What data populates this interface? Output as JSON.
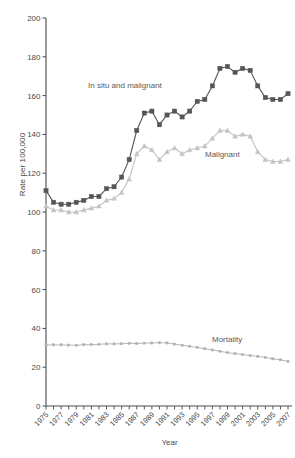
{
  "chart_data": {
    "type": "line",
    "title": "",
    "xlabel": "Year",
    "ylabel": "Rate per 100,000",
    "xlim": [
      1975,
      2007
    ],
    "ylim": [
      0,
      200
    ],
    "yticks": [
      0,
      20,
      40,
      60,
      80,
      100,
      120,
      140,
      160,
      180,
      200
    ],
    "ytick_labels": [
      "0",
      "20",
      "40",
      "60",
      "80",
      "100",
      "120",
      "140",
      "160",
      "180",
      "200"
    ],
    "xticks": [
      1975,
      1976,
      1977,
      1978,
      1979,
      1980,
      1981,
      1982,
      1983,
      1984,
      1985,
      1986,
      1987,
      1988,
      1989,
      1990,
      1991,
      1992,
      1993,
      1994,
      1995,
      1996,
      1997,
      1998,
      1999,
      2000,
      2001,
      2002,
      2003,
      2004,
      2005,
      2006,
      2007
    ],
    "xtick_labels": [
      "1975",
      "",
      "1977",
      "",
      "1979",
      "",
      "1981",
      "",
      "1983",
      "",
      "1985",
      "",
      "1987",
      "",
      "1989",
      "",
      "1991",
      "",
      "1993",
      "",
      "1995",
      "",
      "1997",
      "",
      "1999",
      "",
      "2001",
      "",
      "2003",
      "",
      "2005",
      "",
      "2007"
    ],
    "grid": false,
    "legend_position": "inline-annotations",
    "x": [
      1975,
      1976,
      1977,
      1978,
      1979,
      1980,
      1981,
      1982,
      1983,
      1984,
      1985,
      1986,
      1987,
      1988,
      1989,
      1990,
      1991,
      1992,
      1993,
      1994,
      1995,
      1996,
      1997,
      1998,
      1999,
      2000,
      2001,
      2002,
      2003,
      2004,
      2005,
      2006,
      2007
    ],
    "series": [
      {
        "name": "In situ and malignant",
        "label": "In situ and malignant",
        "color": "#555555",
        "marker": "square",
        "values": [
          111,
          105,
          104,
          104,
          105,
          106,
          108,
          108,
          112,
          113,
          118,
          127,
          142,
          151,
          152,
          145,
          150,
          152,
          149,
          152,
          157,
          158,
          165,
          174,
          175,
          172,
          174,
          173,
          165,
          159,
          158,
          158,
          161
        ]
      },
      {
        "name": "Malignant",
        "label": "Malignant",
        "color": "#c4c4c4",
        "marker": "triangle",
        "values": [
          103,
          101,
          101,
          100,
          100,
          101,
          102,
          103,
          106,
          107,
          110,
          117,
          130,
          134,
          132,
          127,
          131,
          133,
          130,
          132,
          133,
          134,
          138,
          142,
          142,
          139,
          140,
          139,
          131,
          127,
          126,
          126,
          127
        ]
      },
      {
        "name": "Mortality",
        "label": "Mortality",
        "color": "#b0b0b0",
        "marker": "small",
        "values": [
          31.5,
          31.5,
          31.5,
          31.4,
          31.3,
          31.6,
          31.6,
          31.8,
          32,
          32,
          32.1,
          32.3,
          32.2,
          32.4,
          32.5,
          32.6,
          32.5,
          31.9,
          31.3,
          30.8,
          30.2,
          29.5,
          28.9,
          28.2,
          27.5,
          27,
          26.5,
          26,
          25.6,
          25,
          24.3,
          23.8,
          23
        ]
      }
    ],
    "annotations": [
      {
        "text": "In situ and malignant",
        "x": 1985,
        "y": 185
      },
      {
        "text": "Malignant",
        "x": 1998,
        "y": 143
      },
      {
        "text": "Mortality",
        "x": 1999,
        "y": 52
      }
    ]
  },
  "axis": {
    "y_title": "Rate per 100,000",
    "x_title": "Year"
  }
}
